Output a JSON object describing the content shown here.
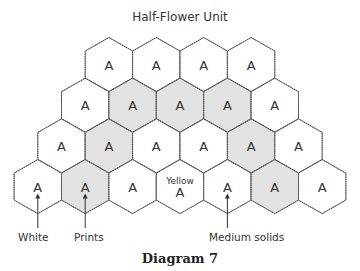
{
  "title": "Half-Flower Unit",
  "caption": "Diagram 7",
  "colors": {
    "white": "#ffffff",
    "print": "#e2e2e2",
    "outline": "#777777",
    "seam": "#444444"
  },
  "rows": [
    {
      "cells": [
        {
          "label": "A",
          "fill": "white"
        },
        {
          "label": "A",
          "fill": "white"
        },
        {
          "label": "A",
          "fill": "white"
        },
        {
          "label": "A",
          "fill": "white"
        }
      ]
    },
    {
      "cells": [
        {
          "label": "A",
          "fill": "white"
        },
        {
          "label": "A",
          "fill": "print"
        },
        {
          "label": "A",
          "fill": "print"
        },
        {
          "label": "A",
          "fill": "print"
        },
        {
          "label": "A",
          "fill": "white"
        }
      ]
    },
    {
      "cells": [
        {
          "label": "A",
          "fill": "white"
        },
        {
          "label": "A",
          "fill": "print"
        },
        {
          "label": "A",
          "fill": "white"
        },
        {
          "label": "A",
          "fill": "white"
        },
        {
          "label": "A",
          "fill": "print"
        },
        {
          "label": "A",
          "fill": "white"
        }
      ]
    },
    {
      "cells": [
        {
          "label": "A",
          "fill": "white"
        },
        {
          "label": "A",
          "fill": "print"
        },
        {
          "label": "A",
          "fill": "white"
        },
        {
          "label": "A",
          "fill": "white",
          "note": "Yellow"
        },
        {
          "label": "A",
          "fill": "white"
        },
        {
          "label": "A",
          "fill": "print"
        },
        {
          "label": "A",
          "fill": "white"
        }
      ]
    }
  ],
  "callouts": [
    {
      "text": "White",
      "row": 3,
      "col": 0
    },
    {
      "text": "Prints",
      "row": 3,
      "col": 1
    },
    {
      "text": "Medium solids",
      "row": 3,
      "col": 4
    }
  ]
}
